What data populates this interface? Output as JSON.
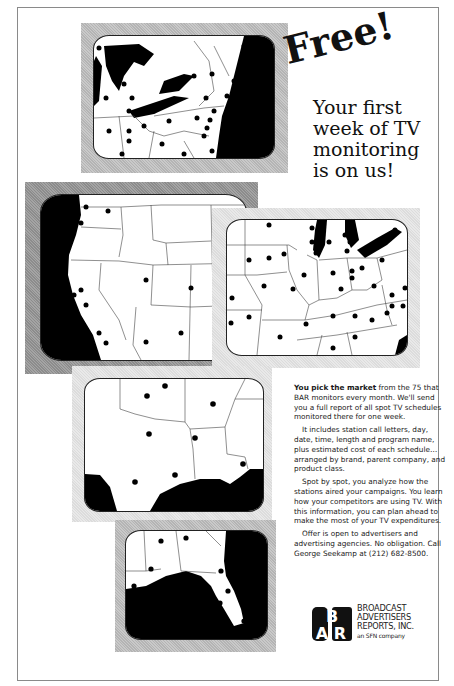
{
  "headline": {
    "free": "Free!",
    "lines": [
      "Your first",
      "week of TV",
      "monitoring",
      "is on us!"
    ]
  },
  "body": {
    "p1_lead": "You pick the market",
    "p1_rest": " from the 75 that BAR monitors every month. We'll send you a full report of all spot TV schedules monitored there for one week.",
    "p2": "It includes station call letters, day, date, time, length and program name, plus estimated cost of each schedule…arranged by brand, parent company, and product class.",
    "p3": "Spot by spot, you analyze how the stations aired your campaigns. You learn how your competitors are using TV. With this information, you can plan ahead to make the most of your TV expenditures.",
    "p4": "Offer is open to advertisers and advertising agencies. No obligation. Call George Seekamp at (212) 682-8500."
  },
  "logo": {
    "mark": "BAR",
    "lines": [
      "BROADCAST",
      "ADVERTISERS",
      "REPORTS, INC."
    ],
    "tagline": "an SFN company"
  },
  "maps": [
    {
      "region": "Northeast / Great Lakes",
      "frame_tone": "mid"
    },
    {
      "region": "West",
      "frame_tone": "dark"
    },
    {
      "region": "Midwest",
      "frame_tone": "light"
    },
    {
      "region": "South Central / Gulf",
      "frame_tone": "light"
    },
    {
      "region": "Southeast / Florida",
      "frame_tone": "mid"
    }
  ]
}
